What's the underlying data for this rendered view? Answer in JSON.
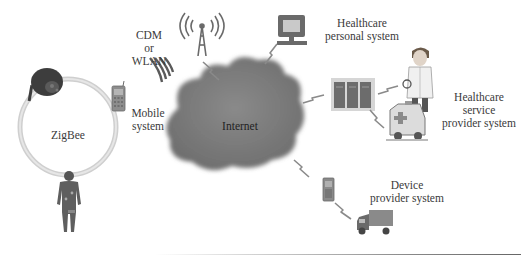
{
  "diagram": {
    "type": "network-architecture",
    "nodes": {
      "zigbee": {
        "label": "ZigBee"
      },
      "cdm_wlan": {
        "lines": [
          "CDM",
          "or",
          "WLAN"
        ]
      },
      "mobile": {
        "lines": [
          "Mobile",
          "system"
        ]
      },
      "internet": {
        "label": "Internet"
      },
      "personal": {
        "lines": [
          "Healthcare",
          "personal system"
        ]
      },
      "service": {
        "lines": [
          "Healthcare",
          "service",
          "provider system"
        ]
      },
      "device": {
        "lines": [
          "Device",
          "provider system"
        ]
      }
    },
    "edges": [
      [
        "cell-tower",
        "internet"
      ],
      [
        "computer",
        "internet"
      ],
      [
        "internet",
        "servers"
      ],
      [
        "servers",
        "doctor"
      ],
      [
        "servers",
        "ambulance"
      ],
      [
        "internet",
        "phone-device"
      ],
      [
        "phone-device",
        "truck"
      ]
    ],
    "colors": {
      "cloud": "#7a7a7a",
      "ring": "#c8c8c8",
      "icon_dark": "#555555",
      "arrow": "#808080"
    }
  }
}
